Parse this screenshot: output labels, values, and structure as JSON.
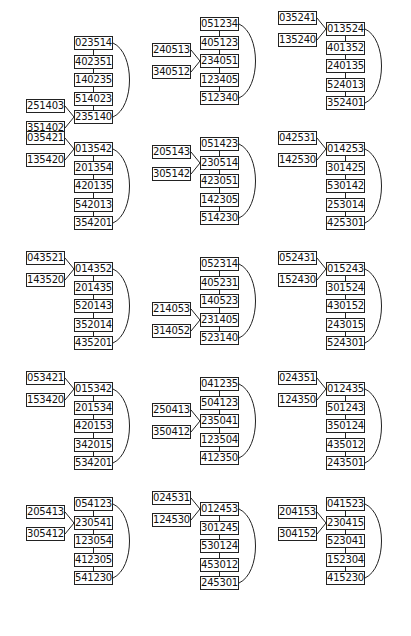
{
  "diagram": {
    "panels": [
      {
        "chain": [
          "023514",
          "402351",
          "140235",
          "514023",
          "235140"
        ],
        "side": [
          "251403",
          "351402"
        ],
        "side_target": 4
      },
      {
        "chain": [
          "051234",
          "405123",
          "234051",
          "123405",
          "512340"
        ],
        "side": [
          "240513",
          "340512"
        ],
        "side_target": 2
      },
      {
        "chain": [
          "013524",
          "401352",
          "240135",
          "524013",
          "352401"
        ],
        "side": [
          "035241",
          "135240"
        ],
        "side_target": 0
      },
      {
        "chain": [
          "013542",
          "201354",
          "420135",
          "542013",
          "354201"
        ],
        "side": [
          "035421",
          "135420"
        ],
        "side_target": 0
      },
      {
        "chain": [
          "051423",
          "230514",
          "423051",
          "142305",
          "514230"
        ],
        "side": [
          "205143",
          "305142"
        ],
        "side_target": 1
      },
      {
        "chain": [
          "014253",
          "301425",
          "530142",
          "253014",
          "425301"
        ],
        "side": [
          "042531",
          "142530"
        ],
        "side_target": 0
      },
      {
        "chain": [
          "014352",
          "201435",
          "520143",
          "352014",
          "435201"
        ],
        "side": [
          "043521",
          "143520"
        ],
        "side_target": 0
      },
      {
        "chain": [
          "052314",
          "405231",
          "140523",
          "231405",
          "523140"
        ],
        "side": [
          "214053",
          "314052"
        ],
        "side_target": 3
      },
      {
        "chain": [
          "015243",
          "301524",
          "430152",
          "243015",
          "524301"
        ],
        "side": [
          "052431",
          "152430"
        ],
        "side_target": 0
      },
      {
        "chain": [
          "015342",
          "201534",
          "420153",
          "342015",
          "534201"
        ],
        "side": [
          "053421",
          "153420"
        ],
        "side_target": 0
      },
      {
        "chain": [
          "041235",
          "504123",
          "235041",
          "123504",
          "412350"
        ],
        "side": [
          "250413",
          "350412"
        ],
        "side_target": 2
      },
      {
        "chain": [
          "012435",
          "501243",
          "350124",
          "435012",
          "243501"
        ],
        "side": [
          "024351",
          "124350"
        ],
        "side_target": 0
      },
      {
        "chain": [
          "054123",
          "230541",
          "123054",
          "412305",
          "541230"
        ],
        "side": [
          "205413",
          "305412"
        ],
        "side_target": 1
      },
      {
        "chain": [
          "012453",
          "301245",
          "530124",
          "453012",
          "245301"
        ],
        "side": [
          "024531",
          "124530"
        ],
        "side_target": 0
      },
      {
        "chain": [
          "041523",
          "230415",
          "523041",
          "152304",
          "415230"
        ],
        "side": [
          "204153",
          "304152"
        ],
        "side_target": 1
      }
    ],
    "layout": {
      "chain_x": [
        74,
        200,
        326
      ],
      "row_top": [
        7,
        127,
        247,
        367,
        487
      ],
      "step": 18.5,
      "line_color": "#222222"
    }
  }
}
